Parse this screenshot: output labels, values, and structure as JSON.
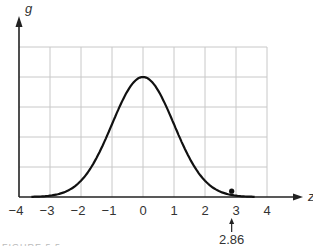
{
  "chart_data": {
    "type": "line",
    "title": "",
    "xlabel": "z",
    "ylabel": "g",
    "xlim": [
      -4,
      4
    ],
    "ylim": [
      0,
      5
    ],
    "grid": true,
    "x_ticks": [
      "−4",
      "−3",
      "−2",
      "−1",
      "0",
      "1",
      "2",
      "3",
      "4"
    ],
    "series": [
      {
        "name": "g(z) standard normal density curve",
        "x": [
          -3.5,
          -3,
          -2.5,
          -2,
          -1.5,
          -1,
          -0.5,
          0,
          0.5,
          1,
          1.5,
          2,
          2.5,
          3,
          3.5
        ],
        "y": [
          0.009,
          0.044,
          0.175,
          0.54,
          1.295,
          2.42,
          3.52,
          4.0,
          3.52,
          2.42,
          1.295,
          0.54,
          0.175,
          0.044,
          0.009
        ]
      }
    ],
    "point": {
      "x": 2.86,
      "y": 0.16
    },
    "annotations": [
      {
        "text": "2.86",
        "x": 2.86,
        "type": "arrow-up"
      }
    ]
  },
  "caption": "FIGURE 5.5"
}
